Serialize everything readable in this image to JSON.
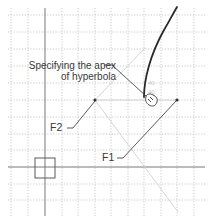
{
  "diagram": {
    "annotation": {
      "line1": "Specifying the apex",
      "line2": "of hyperbola"
    },
    "foci": [
      {
        "label": "F2",
        "x": 95,
        "y": 100
      },
      {
        "label": "F1",
        "x": 177,
        "y": 100
      }
    ],
    "cursor": {
      "icon": "hand-pointer-icon",
      "tooltip_marks": [
        "40",
        "40"
      ]
    },
    "grid": {
      "spacing_px": 16.6,
      "color": "#b8b8b8",
      "axis_color": "#6a6a6a"
    },
    "colors": {
      "curve": "#2a2a2a",
      "leader": "#4a4a4a",
      "construction": "#d4d4d4",
      "text": "#3a3a3a"
    }
  }
}
